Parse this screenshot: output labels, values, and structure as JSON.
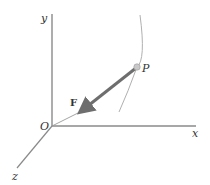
{
  "diagram": {
    "labels": {
      "y_axis": "y",
      "x_axis": "x",
      "z_axis": "z",
      "origin": "O",
      "point": "P",
      "force": "F"
    },
    "colors": {
      "axis": "#8a8a8a",
      "curve": "#b0b0b0",
      "force_vector": "#6e6e6e",
      "point_fill": "#c8c8c8",
      "text": "#333333"
    }
  }
}
